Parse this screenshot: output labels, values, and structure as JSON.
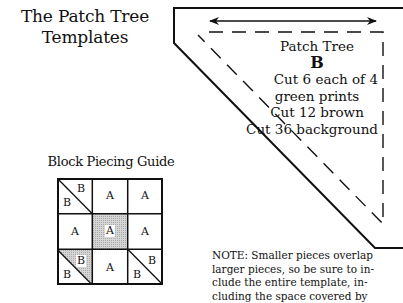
{
  "title": {
    "line1": "The Patch Tree",
    "line2": "Templates"
  },
  "template": {
    "name": "Patch Tree",
    "letter": "B",
    "instructions": [
      "Cut 6 each of 4",
      "green prints",
      "Cut 12 brown",
      "Cut 36 background"
    ],
    "grain_arrow": "double-arrow-icon"
  },
  "guide": {
    "title": "Block Piecing Guide",
    "cells": [
      {
        "row": 0,
        "col": 0,
        "type": "half-square",
        "labels": [
          "B",
          "B"
        ],
        "shaded": false
      },
      {
        "row": 0,
        "col": 1,
        "type": "square",
        "labels": [
          "A"
        ],
        "shaded": false
      },
      {
        "row": 0,
        "col": 2,
        "type": "square",
        "labels": [
          "A"
        ],
        "shaded": false
      },
      {
        "row": 1,
        "col": 0,
        "type": "square",
        "labels": [
          "A"
        ],
        "shaded": false
      },
      {
        "row": 1,
        "col": 1,
        "type": "square",
        "labels": [
          "A"
        ],
        "shaded": true
      },
      {
        "row": 1,
        "col": 2,
        "type": "square",
        "labels": [
          "A"
        ],
        "shaded": false
      },
      {
        "row": 2,
        "col": 0,
        "type": "half-square",
        "labels": [
          "B",
          "B"
        ],
        "shaded": "upper"
      },
      {
        "row": 2,
        "col": 1,
        "type": "square",
        "labels": [
          "A"
        ],
        "shaded": false
      },
      {
        "row": 2,
        "col": 2,
        "type": "half-square",
        "labels": [
          "B",
          "B"
        ],
        "shaded": false
      }
    ]
  },
  "note": {
    "lines": [
      "NOTE: Smaller pieces overlap",
      "larger pieces, so be sure to in-",
      "clude the entire template, in-",
      "cluding the space covered by"
    ]
  },
  "colors": {
    "ink": "#111111",
    "shade": "#c8c8c8",
    "paper": "#ffffff"
  }
}
